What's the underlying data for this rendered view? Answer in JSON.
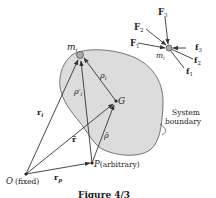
{
  "figure": {
    "caption": "Figure 4/3",
    "labels": {
      "m_i": "m",
      "m_i_sub": "i",
      "G": "G",
      "rho_i": "ρ",
      "rho_i_sub": "i",
      "rho_prime": "ρ′",
      "rho_prime_sub": "i",
      "r_i": "r",
      "r_i_sub": "i",
      "r_bar": "r̄",
      "rho_bar": "ρ̄",
      "O": "O",
      "O_note": "(fixed)",
      "P": "P",
      "P_note": "(arbitrary)",
      "r_p": "r",
      "r_p_sub": "p",
      "boundary_line1": "System",
      "boundary_line2": "boundary"
    },
    "force_inset": {
      "particle": "m",
      "particle_sub": "i",
      "external_forces": [
        {
          "name": "F",
          "sub": "1"
        },
        {
          "name": "F",
          "sub": "2"
        },
        {
          "name": "F",
          "sub": "3"
        }
      ],
      "internal_forces": [
        {
          "name": "f",
          "sub": "1"
        },
        {
          "name": "f",
          "sub": "2"
        },
        {
          "name": "f",
          "sub": "3"
        }
      ]
    },
    "colors": {
      "body_fill": "#dcdcdc",
      "line": "#333333",
      "particle": "#aaaaaa"
    }
  }
}
